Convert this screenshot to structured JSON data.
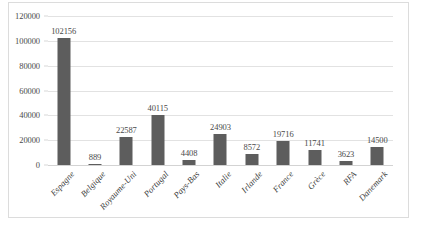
{
  "chart_data": {
    "type": "bar",
    "title": "",
    "subtitle": "",
    "xlabel": "",
    "ylabel": "",
    "categories": [
      "Espagne",
      "Belgique",
      "Royaume-Uni",
      "Portugal",
      "Pays-Bas",
      "Italie",
      "Irlande",
      "France",
      "Grèce",
      "RFA",
      "Danemark"
    ],
    "values": [
      102156,
      889,
      22587,
      40115,
      4408,
      24903,
      8572,
      19716,
      11741,
      3623,
      14500
    ],
    "data_labels": [
      "102156",
      "889",
      "22587",
      "40115",
      "4408",
      "24903",
      "8572",
      "19716",
      "11741",
      "3623",
      "14500"
    ],
    "series": [
      {
        "name": "",
        "values": [
          102156,
          889,
          22587,
          40115,
          4408,
          24903,
          8572,
          19716,
          11741,
          3623,
          14500
        ]
      }
    ],
    "ylim": [
      0,
      120000
    ],
    "ytick_values": [
      0,
      20000,
      40000,
      60000,
      80000,
      100000,
      120000
    ],
    "ytick_labels": [
      "0",
      "20000",
      "40000",
      "60000",
      "80000",
      "100000",
      "120000"
    ],
    "ytick_step": 20000,
    "grid": true,
    "grid_axis": "y",
    "legend": false,
    "legend_position": "none",
    "bar_color": "#5d5d5d",
    "gridline_color": "#e2e2e2",
    "background_color": "#ffffff",
    "border_color": "#dcdcdc",
    "text_color": "#4a4a4a",
    "xtick_label_rotation": -47
  }
}
